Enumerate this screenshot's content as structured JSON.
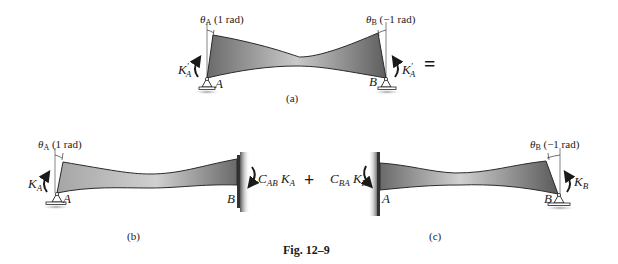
{
  "figure": {
    "caption": "Fig. 12–9",
    "operator_equals": "=",
    "operator_plus": "+"
  },
  "panel_a": {
    "label": "(a)",
    "theta_left": {
      "symbol": "θ",
      "sub": "A",
      "value": " (1 rad)"
    },
    "theta_right": {
      "symbol": "θ",
      "sub": "B",
      "value": " (−1 rad)"
    },
    "moment_left": {
      "symbol": "K",
      "sup": "′",
      "sub": "A"
    },
    "moment_right": {
      "symbol": "K",
      "sup": "′",
      "sub": "A"
    },
    "joint_left": "A",
    "joint_right": "B"
  },
  "panel_b": {
    "label": "(b)",
    "theta_left": {
      "symbol": "θ",
      "sub": "A",
      "value": " (1 rad)"
    },
    "moment_left": {
      "symbol": "K",
      "sub": "A"
    },
    "moment_right": {
      "c": "C",
      "csub": "AB",
      "k": " K",
      "ksub": "A"
    },
    "joint_left": "A",
    "joint_right": "B"
  },
  "panel_c": {
    "label": "(c)",
    "theta_right": {
      "symbol": "θ",
      "sub": "B",
      "value": " (−1 rad)"
    },
    "moment_left": {
      "c": "C",
      "csub": "BA",
      "k": " K",
      "ksub": "B"
    },
    "moment_right": {
      "symbol": "K",
      "sub": "B"
    },
    "joint_left": "A",
    "joint_right": "B"
  },
  "colors": {
    "beam_dark": "#6e6e6e",
    "beam_light": "#c8c8c8",
    "wall": "#7a7a7a",
    "ink": "#1a1a1a"
  }
}
